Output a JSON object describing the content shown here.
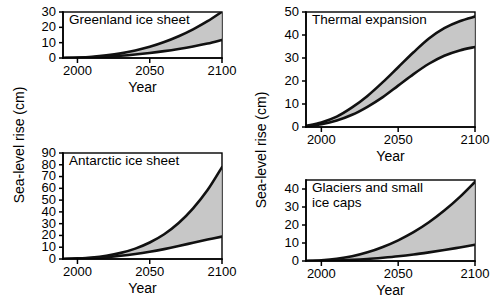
{
  "figure": {
    "width": 494,
    "height": 306,
    "background": "#ffffff",
    "curve_color": "#111111",
    "band_color": "#bdbdbd"
  },
  "axis_titles": {
    "x": "Year",
    "y": "Sea-level rise (cm)"
  },
  "chart_data": [
    {
      "id": "greenland-ice-sheet",
      "type": "area",
      "title": "Greenland ice sheet",
      "xlabel": "Year",
      "ylabel": "Sea-level rise (cm)",
      "xlim": [
        1990,
        2100
      ],
      "ylim": [
        0,
        30
      ],
      "xticks": [
        2000,
        2050,
        2100
      ],
      "xticklabels": [
        "2000",
        "2050",
        "2100"
      ],
      "yticks": [
        0,
        10,
        20,
        30
      ],
      "yticklabels": [
        "0",
        "10",
        "20",
        "30"
      ],
      "grid": false,
      "legend": "none",
      "x": [
        1990,
        2000,
        2010,
        2020,
        2030,
        2040,
        2050,
        2060,
        2070,
        2080,
        2090,
        2100
      ],
      "series": [
        {
          "name": "upper bound",
          "values": [
            0.0,
            0.3,
            0.8,
            1.7,
            3.0,
            4.9,
            7.3,
            10.4,
            14.2,
            18.7,
            24.0,
            30.2
          ]
        },
        {
          "name": "lower bound",
          "values": [
            0.0,
            0.2,
            0.5,
            0.9,
            1.5,
            2.3,
            3.3,
            4.5,
            5.9,
            7.5,
            9.4,
            11.8
          ]
        }
      ]
    },
    {
      "id": "antarctic-ice-sheet",
      "type": "area",
      "title": "Antarctic ice sheet",
      "xlabel": "Year",
      "ylabel": "Sea-level rise (cm)",
      "xlim": [
        1990,
        2100
      ],
      "ylim": [
        0,
        90
      ],
      "xticks": [
        2000,
        2050,
        2100
      ],
      "xticklabels": [
        "2000",
        "2050",
        "2100"
      ],
      "yticks": [
        0,
        10,
        20,
        30,
        40,
        50,
        60,
        70,
        80,
        90
      ],
      "yticklabels": [
        "0",
        "10",
        "20",
        "30",
        "40",
        "50",
        "60",
        "70",
        "80",
        "90"
      ],
      "grid": false,
      "legend": "none",
      "x": [
        1990,
        2000,
        2010,
        2020,
        2030,
        2040,
        2050,
        2060,
        2070,
        2080,
        2090,
        2100
      ],
      "series": [
        {
          "name": "upper bound",
          "values": [
            0.0,
            0.5,
            1.3,
            2.8,
            5.2,
            8.8,
            14.0,
            21.0,
            30.5,
            43.0,
            58.5,
            78.0
          ]
        },
        {
          "name": "lower bound",
          "values": [
            0.0,
            0.3,
            0.8,
            1.6,
            2.7,
            4.2,
            6.1,
            8.4,
            11.0,
            13.8,
            16.5,
            19.0
          ]
        }
      ]
    },
    {
      "id": "thermal-expansion",
      "type": "area",
      "title": "Thermal expansion",
      "xlabel": "Year",
      "ylabel": "Sea-level rise (cm)",
      "xlim": [
        1990,
        2100
      ],
      "ylim": [
        0,
        50
      ],
      "xticks": [
        2000,
        2050,
        2100
      ],
      "xticklabels": [
        "2000",
        "2050",
        "2100"
      ],
      "yticks": [
        0,
        10,
        20,
        30,
        40,
        50
      ],
      "yticklabels": [
        "0",
        "10",
        "20",
        "30",
        "40",
        "50"
      ],
      "grid": false,
      "legend": "none",
      "x": [
        1990,
        2000,
        2010,
        2020,
        2030,
        2040,
        2050,
        2060,
        2070,
        2080,
        2090,
        2100
      ],
      "series": [
        {
          "name": "upper bound",
          "values": [
            0.5,
            2.0,
            4.5,
            8.5,
            13.5,
            19.5,
            26.0,
            32.5,
            38.5,
            43.0,
            46.0,
            48.0
          ]
        },
        {
          "name": "lower bound",
          "values": [
            0.3,
            1.2,
            2.8,
            5.3,
            8.8,
            13.0,
            18.0,
            23.0,
            27.5,
            31.0,
            33.3,
            34.8
          ]
        }
      ]
    },
    {
      "id": "glaciers-and-small-ice-caps",
      "type": "area",
      "title": "Glaciers and small ice caps",
      "title_line1": "Glaciers and small",
      "title_line2": "ice caps",
      "xlabel": "Year",
      "ylabel": "Sea-level rise (cm)",
      "xlim": [
        1990,
        2100
      ],
      "ylim": [
        0,
        45
      ],
      "xticks": [
        2000,
        2050,
        2100
      ],
      "xticklabels": [
        "2000",
        "2050",
        "2100"
      ],
      "yticks": [
        0,
        10,
        20,
        30,
        40
      ],
      "yticklabels": [
        "0",
        "10",
        "20",
        "30",
        "40"
      ],
      "grid": false,
      "legend": "none",
      "x": [
        1990,
        2000,
        2010,
        2020,
        2030,
        2040,
        2050,
        2060,
        2070,
        2080,
        2090,
        2100
      ],
      "series": [
        {
          "name": "upper bound",
          "values": [
            0.0,
            0.4,
            1.2,
            2.6,
            4.8,
            7.8,
            11.5,
            16.0,
            21.5,
            28.0,
            35.5,
            44.0
          ]
        },
        {
          "name": "lower bound",
          "values": [
            0.0,
            0.1,
            0.3,
            0.6,
            1.1,
            1.8,
            2.6,
            3.6,
            4.8,
            6.1,
            7.5,
            9.0
          ]
        }
      ]
    }
  ]
}
